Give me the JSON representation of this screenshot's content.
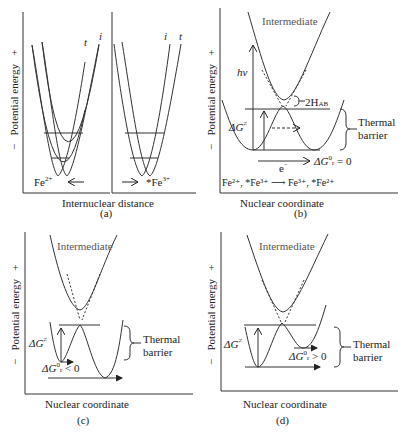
{
  "panels": {
    "a": {
      "caption": "(a)",
      "y_axis_label": "Potential energy",
      "y_minus": "−",
      "y_plus": "+",
      "x_axis_label": "Internuclear distance",
      "left": {
        "curve_labels": [
          "t",
          "i"
        ],
        "ion": "Fe",
        "ion_charge": "2+",
        "arrow": "←"
      },
      "right": {
        "curve_labels": [
          "i",
          "t"
        ],
        "ion": "*Fe",
        "ion_charge": "3+",
        "arrow": "→"
      }
    },
    "b": {
      "caption": "(b)",
      "y_axis_label": "Potential energy",
      "y_minus": "−",
      "y_plus": "+",
      "x_axis_label": "Nuclear coordinate",
      "intermediate_label": "Intermediate",
      "hv_label": "hν",
      "delta_g_label": "ΔG",
      "delta_g_sup": "≠",
      "coupling_label": "2H",
      "coupling_sub": "AB",
      "barrier_label_1": "Thermal",
      "barrier_label_2": "barrier",
      "electron_label": "e",
      "electron_sup": "−",
      "dg0_label": "ΔG",
      "dg0_sub": "r",
      "dg0_sup": "0",
      "dg0_rel": "= 0",
      "reaction": {
        "reactants": "Fe²⁺, *Fe³⁺",
        "arrow": "⟶",
        "products": "Fe³⁺, *Fe²⁺"
      }
    },
    "c": {
      "caption": "(c)",
      "y_axis_label": "Potential energy",
      "y_minus": "−",
      "y_plus": "+",
      "x_axis_label": "Nuclear coordinate",
      "intermediate_label": "Intermediate",
      "delta_g_label": "ΔG",
      "delta_g_sup": "≠",
      "barrier_label_1": "Thermal",
      "barrier_label_2": "barrier",
      "dg0_label": "ΔG",
      "dg0_sub": "r",
      "dg0_sup": "0",
      "dg0_rel": "< 0"
    },
    "d": {
      "caption": "(d)",
      "y_axis_label": "Potential energy",
      "y_minus": "−",
      "y_plus": "+",
      "x_axis_label": "Nuclear coordinate",
      "intermediate_label": "Intermediate",
      "delta_g_label": "ΔG",
      "delta_g_sup": "≠",
      "barrier_label_1": "Thermal",
      "barrier_label_2": "barrier",
      "dg0_label": "ΔG",
      "dg0_sub": "r",
      "dg0_sup": "0",
      "dg0_rel": "> 0"
    }
  }
}
